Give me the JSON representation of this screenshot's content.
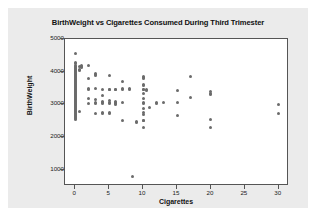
{
  "chart_data": {
    "type": "scatter",
    "title": "BirthWeight vs Cigarettes Consumed During Third Trimester",
    "xlabel": "Cigarettes",
    "ylabel": "BirthWeight",
    "xlim": [
      -1.5,
      31.5
    ],
    "ylim": [
      500,
      5000
    ],
    "xticks": [
      0,
      5,
      10,
      15,
      20,
      25,
      30
    ],
    "yticks": [
      1000,
      2000,
      3000,
      4000,
      5000
    ],
    "grid": false,
    "legend": null,
    "marker_color": "#6b6b6b",
    "plot_bg": "#ffffff",
    "panel_bg": "#ebebeb",
    "frame_color": "#555555",
    "series": [
      {
        "name": "Births",
        "points": [
          [
            0,
            4570
          ],
          [
            0,
            4280
          ],
          [
            0,
            4240
          ],
          [
            0,
            4180
          ],
          [
            0,
            4150
          ],
          [
            0,
            4120
          ],
          [
            0,
            4090
          ],
          [
            0,
            4060
          ],
          [
            0,
            4030
          ],
          [
            0,
            4000
          ],
          [
            0,
            3960
          ],
          [
            0,
            3930
          ],
          [
            0,
            3900
          ],
          [
            0,
            3870
          ],
          [
            0,
            3840
          ],
          [
            0,
            3810
          ],
          [
            0,
            3780
          ],
          [
            0,
            3750
          ],
          [
            0,
            3720
          ],
          [
            0,
            3690
          ],
          [
            0,
            3660
          ],
          [
            0,
            3630
          ],
          [
            0,
            3600
          ],
          [
            0,
            3570
          ],
          [
            0,
            3540
          ],
          [
            0,
            3510
          ],
          [
            0,
            3480
          ],
          [
            0,
            3450
          ],
          [
            0,
            3420
          ],
          [
            0,
            3390
          ],
          [
            0,
            3360
          ],
          [
            0,
            3330
          ],
          [
            0,
            3300
          ],
          [
            0,
            3270
          ],
          [
            0,
            3240
          ],
          [
            0,
            3210
          ],
          [
            0,
            3180
          ],
          [
            0,
            3150
          ],
          [
            0,
            3120
          ],
          [
            0,
            3090
          ],
          [
            0,
            3060
          ],
          [
            0,
            3030
          ],
          [
            0,
            3000
          ],
          [
            0,
            2970
          ],
          [
            0,
            2940
          ],
          [
            0,
            2910
          ],
          [
            0,
            2880
          ],
          [
            0,
            2850
          ],
          [
            0,
            2820
          ],
          [
            0,
            2790
          ],
          [
            0,
            2760
          ],
          [
            0,
            2730
          ],
          [
            0,
            2700
          ],
          [
            0,
            2670
          ],
          [
            0,
            2640
          ],
          [
            0,
            2610
          ],
          [
            0,
            2580
          ],
          [
            0,
            2550
          ],
          [
            0.6,
            4150
          ],
          [
            0.6,
            4080
          ],
          [
            0.6,
            4050
          ],
          [
            0.6,
            2780
          ],
          [
            1,
            4180
          ],
          [
            1,
            4150
          ],
          [
            1,
            4120
          ],
          [
            2,
            4190
          ],
          [
            2,
            3790
          ],
          [
            2,
            3470
          ],
          [
            2,
            3450
          ],
          [
            2,
            3190
          ],
          [
            2,
            3040
          ],
          [
            3,
            3940
          ],
          [
            3,
            3900
          ],
          [
            3,
            3870
          ],
          [
            3,
            3470
          ],
          [
            3,
            3150
          ],
          [
            3,
            3060
          ],
          [
            3,
            3030
          ],
          [
            3,
            2720
          ],
          [
            4,
            3450
          ],
          [
            4,
            3260
          ],
          [
            4,
            3080
          ],
          [
            4,
            3050
          ],
          [
            4,
            3020
          ],
          [
            4,
            2740
          ],
          [
            4,
            2710
          ],
          [
            5,
            3870
          ],
          [
            5,
            3460
          ],
          [
            5,
            3440
          ],
          [
            5,
            3110
          ],
          [
            5,
            3070
          ],
          [
            5,
            3040
          ],
          [
            5,
            2740
          ],
          [
            5,
            2710
          ],
          [
            6,
            3460
          ],
          [
            6,
            3440
          ],
          [
            6,
            3080
          ],
          [
            6,
            3060
          ],
          [
            6,
            3030
          ],
          [
            6,
            3000
          ],
          [
            7,
            3710
          ],
          [
            7,
            3470
          ],
          [
            7,
            3440
          ],
          [
            7,
            3050
          ],
          [
            7,
            2510
          ],
          [
            8,
            3470
          ],
          [
            8,
            3440
          ],
          [
            8.5,
            790
          ],
          [
            9,
            2480
          ],
          [
            9,
            2450
          ],
          [
            10,
            3850
          ],
          [
            10,
            3810
          ],
          [
            10,
            3780
          ],
          [
            10,
            3620
          ],
          [
            10,
            3590
          ],
          [
            10,
            3450
          ],
          [
            10,
            3440
          ],
          [
            10,
            3330
          ],
          [
            10,
            3180
          ],
          [
            10,
            3050
          ],
          [
            10,
            3020
          ],
          [
            10,
            2880
          ],
          [
            10,
            2740
          ],
          [
            10,
            2700
          ],
          [
            10,
            2520
          ],
          [
            10,
            2490
          ],
          [
            10,
            2290
          ],
          [
            10.5,
            3440
          ],
          [
            10.5,
            3430
          ],
          [
            11,
            2890
          ],
          [
            12,
            3050
          ],
          [
            12,
            3040
          ],
          [
            13,
            3050
          ],
          [
            15,
            3430
          ],
          [
            15,
            3060
          ],
          [
            15,
            2670
          ],
          [
            17,
            3860
          ],
          [
            17,
            3210
          ],
          [
            20,
            3380
          ],
          [
            20,
            3340
          ],
          [
            20,
            3300
          ],
          [
            20,
            2550
          ],
          [
            20,
            2280
          ],
          [
            30,
            3000
          ],
          [
            30,
            2710
          ]
        ]
      }
    ]
  }
}
